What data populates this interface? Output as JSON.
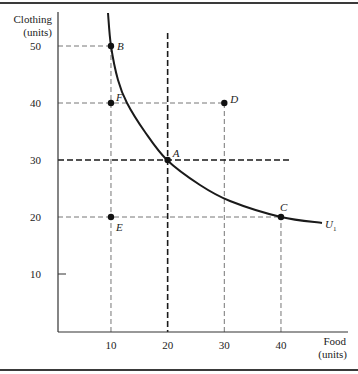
{
  "chart_data": {
    "type": "line",
    "title": "",
    "xlabel": "Food (units)",
    "ylabel": "Clothing (units)",
    "xlabel_lines": [
      "Food",
      "(units)"
    ],
    "ylabel_lines": [
      "Clothing",
      "(units)"
    ],
    "xlim": [
      0,
      50
    ],
    "ylim": [
      0,
      55
    ],
    "x_ticks": [
      10,
      20,
      30,
      40
    ],
    "y_ticks": [
      10,
      20,
      30,
      40,
      50
    ],
    "x_tick_labels": [
      "10",
      "20",
      "30",
      "40"
    ],
    "y_tick_labels": [
      "10",
      "20",
      "30",
      "40",
      "50"
    ],
    "grid": false,
    "series": [
      {
        "name": "U1",
        "label": "U",
        "label_subscript": "1",
        "type": "indifference-curve",
        "points": [
          [
            9.5,
            58
          ],
          [
            10,
            50
          ],
          [
            12.5,
            40
          ],
          [
            20,
            30
          ],
          [
            30,
            23.5
          ],
          [
            40,
            20
          ],
          [
            47,
            19
          ]
        ]
      }
    ],
    "points": [
      {
        "label": "A",
        "food": 20,
        "clothing": 30
      },
      {
        "label": "B",
        "food": 10,
        "clothing": 50
      },
      {
        "label": "C",
        "food": 40,
        "clothing": 20
      },
      {
        "label": "D",
        "food": 30,
        "clothing": 40
      },
      {
        "label": "E",
        "food": 10,
        "clothing": 20
      },
      {
        "label": "F",
        "food": 10,
        "clothing": 40
      }
    ],
    "reference_lines": [
      {
        "orientation": "horizontal",
        "value": 30,
        "style": "bold-dashed"
      },
      {
        "orientation": "vertical",
        "value": 20,
        "style": "bold-dashed"
      }
    ],
    "colors": {
      "ink": "#1a1a1a",
      "dashed": "#555555",
      "frame": "#3a3a3a"
    }
  }
}
